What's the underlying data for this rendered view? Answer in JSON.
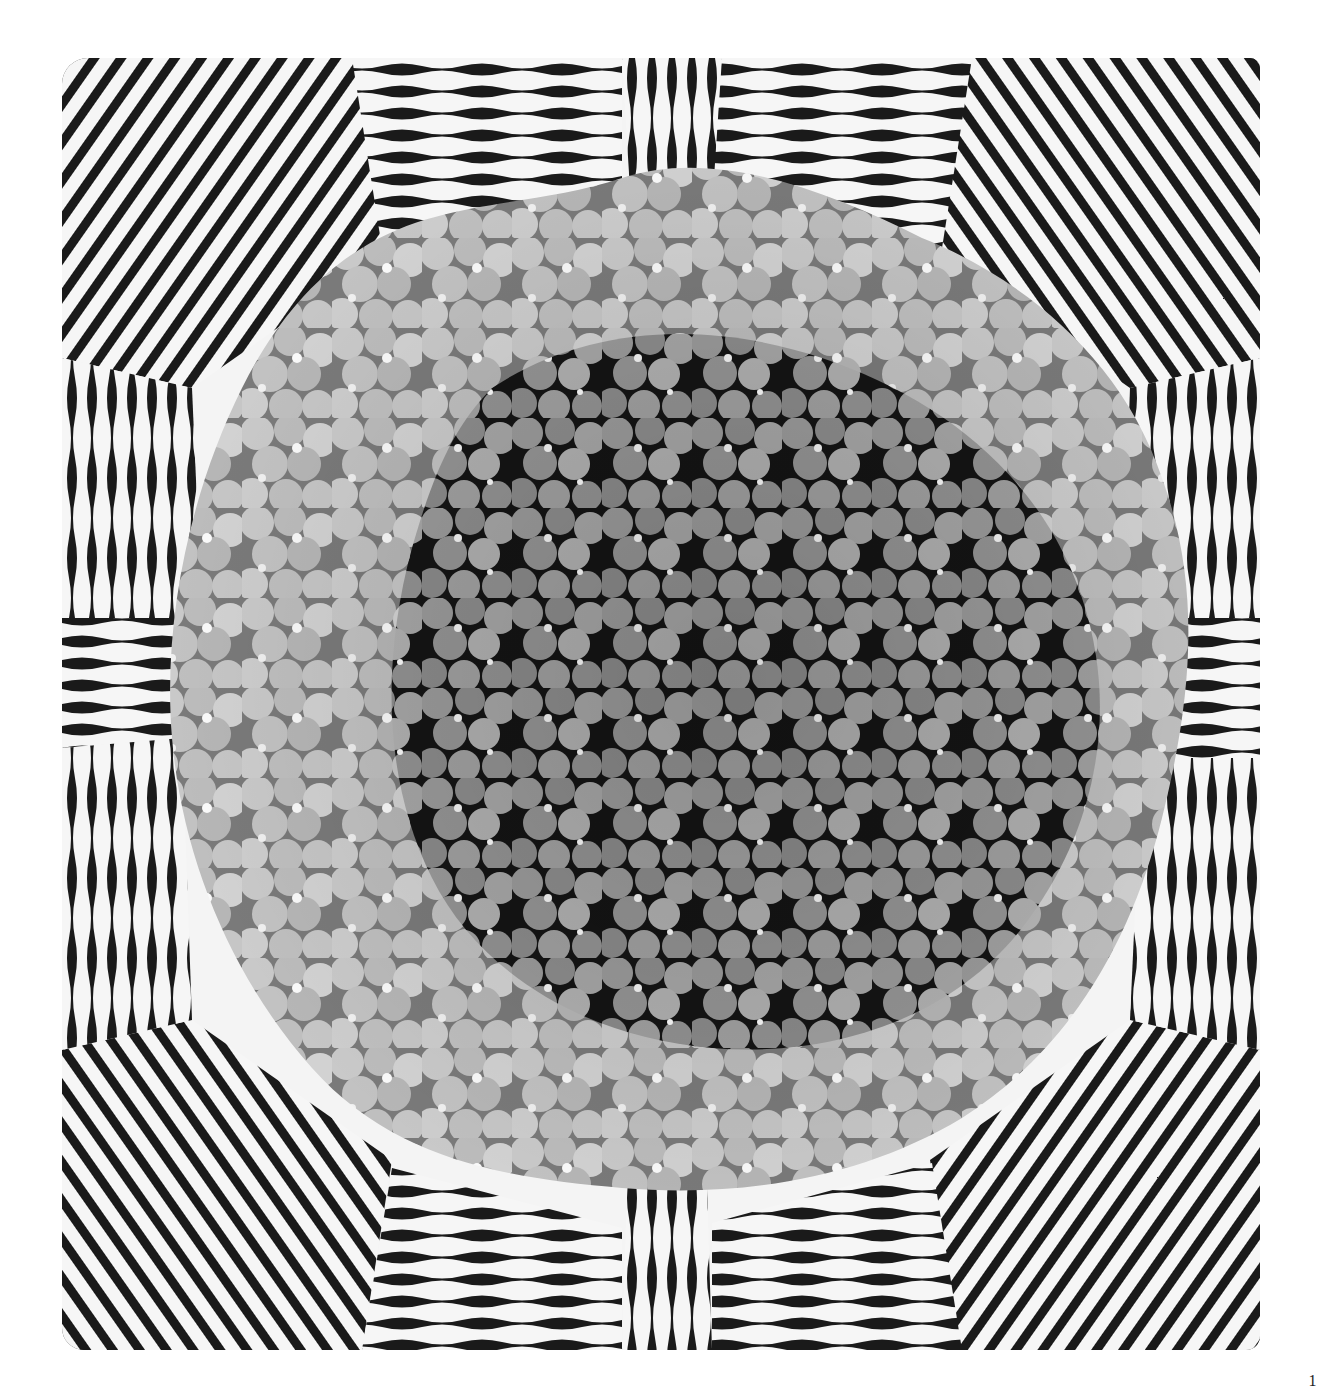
{
  "figure": {
    "border_pattern": "Radiating wavy black stripes in alternating horizontal and vertical panels, diagonal fans at corners",
    "center_pattern": "Dense cluster of overlapping round blossoms in graduated grays with dark gaps and white highlights",
    "colors": {
      "stripe_dark": "#1a1a1a",
      "stripe_light": "#f6f6f6",
      "blossom_light": "#c9c9c9",
      "blossom_mid": "#9a9a9a",
      "blossom_dark": "#6e6e6e",
      "gap": "#141414",
      "highlight": "#fafafa"
    }
  },
  "page": {
    "number": "1"
  }
}
